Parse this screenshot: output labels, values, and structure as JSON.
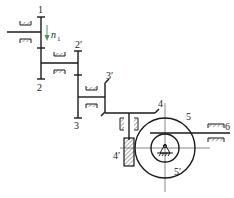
{
  "diagram": {
    "type": "gear-train-mechanism",
    "colors": {
      "line": "#1a1a1a",
      "center_line": "#555555",
      "hatch": "#333333",
      "arrow": "#4a9a5a"
    },
    "labels": {
      "gear1": "1",
      "gear2": "2",
      "gear2p": "2′",
      "gear3": "3",
      "gear3p": "3′",
      "gear4": "4",
      "gear4p": "4′",
      "gear5": "5",
      "gear5p": "5′",
      "rack6": "6",
      "speed_symbol": "n",
      "speed_sub": "1"
    },
    "components": [
      {
        "id": "1",
        "kind": "spur-gear"
      },
      {
        "id": "2",
        "kind": "spur-gear"
      },
      {
        "id": "2′",
        "kind": "spur-gear"
      },
      {
        "id": "3",
        "kind": "spur-gear"
      },
      {
        "id": "3′",
        "kind": "bevel-gear"
      },
      {
        "id": "4",
        "kind": "bevel-gear"
      },
      {
        "id": "4′",
        "kind": "worm"
      },
      {
        "id": "5",
        "kind": "worm-wheel"
      },
      {
        "id": "5′",
        "kind": "pinion"
      },
      {
        "id": "6",
        "kind": "rack"
      }
    ]
  }
}
